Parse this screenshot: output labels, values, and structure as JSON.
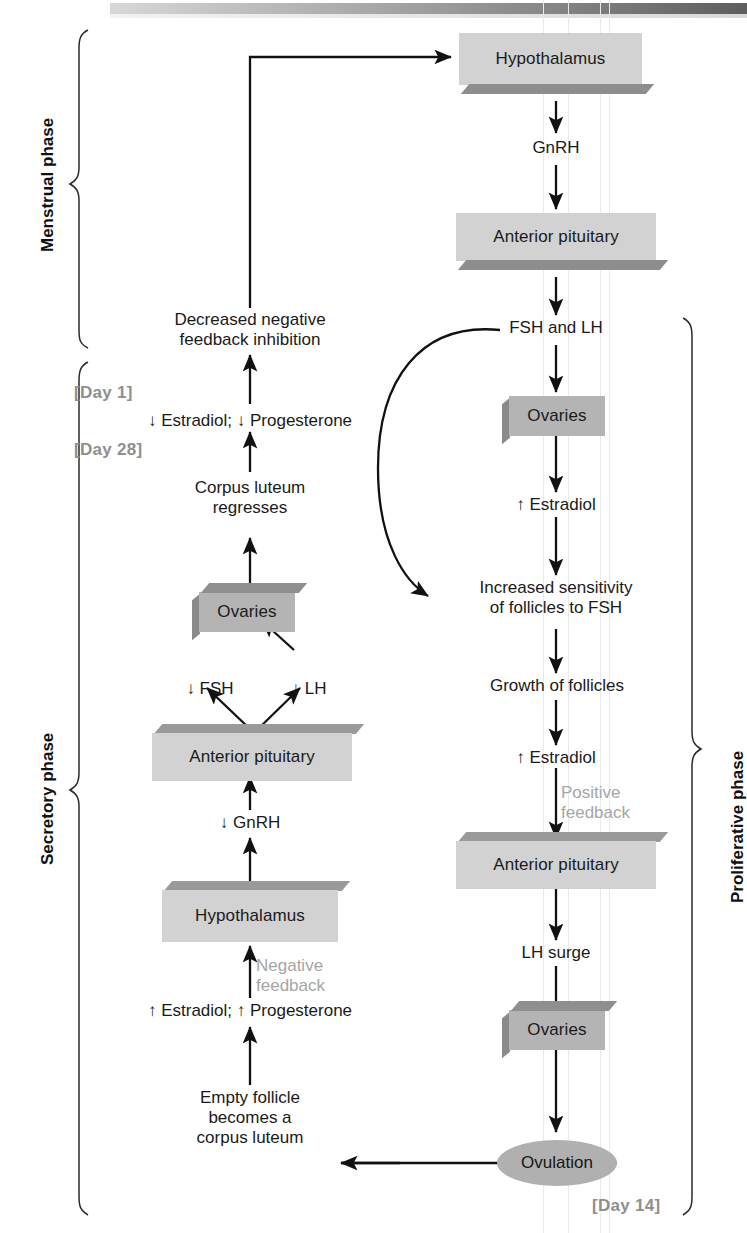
{
  "figure": {
    "title_text": "",
    "type": "flow-diagram"
  },
  "colors": {
    "box_light": "#d2d2d2",
    "box_mid": "#b4b4b4",
    "box_shadow": "#8d8d8d",
    "ellipse": "#b0b0b0",
    "gray_text": "#a6a6a6",
    "day_label": "#8f8f8f",
    "line": "#111111",
    "scanline": "#e9e9e9"
  },
  "phase_labels": {
    "menstrual": "Menstrual phase",
    "secretory": "Secretory phase",
    "proliferative": "Proliferative phase"
  },
  "day_markers": {
    "day1": "[Day 1]",
    "day28": "[Day 28]",
    "day14": "[Day 14]"
  },
  "feedback_labels": {
    "negative": "Negative\nfeedback",
    "positive": "Positive\nfeedback"
  },
  "right_column": {
    "nodes": [
      {
        "id": "hypothalamus-top",
        "kind": "box",
        "style": "light",
        "label": "Hypothalamus"
      },
      {
        "id": "gnrh",
        "kind": "text",
        "label": "GnRH"
      },
      {
        "id": "anterior-pituitary-top",
        "kind": "box",
        "style": "light",
        "label": "Anterior pituitary"
      },
      {
        "id": "fsh-and-lh",
        "kind": "text",
        "label": "FSH and LH"
      },
      {
        "id": "ovaries-upper-right",
        "kind": "box",
        "style": "mid",
        "label": "Ovaries"
      },
      {
        "id": "estradiol-up-1",
        "kind": "text",
        "label": "↑ Estradiol"
      },
      {
        "id": "increased-sensitivity",
        "kind": "text",
        "label": "Increased sensitivity\nof follicles to FSH"
      },
      {
        "id": "growth-of-follicles",
        "kind": "text",
        "label": "Growth of follicles"
      },
      {
        "id": "estradiol-up-2",
        "kind": "text",
        "label": "↑ Estradiol"
      },
      {
        "id": "anterior-pituitary-mid",
        "kind": "box",
        "style": "light",
        "label": "Anterior pituitary"
      },
      {
        "id": "lh-surge",
        "kind": "text",
        "label": "LH surge"
      },
      {
        "id": "ovaries-lower-right",
        "kind": "box",
        "style": "mid",
        "label": "Ovaries"
      },
      {
        "id": "ovulation",
        "kind": "ellipse",
        "label": "Ovulation"
      }
    ]
  },
  "left_column": {
    "nodes": [
      {
        "id": "decreased-negative-feedback",
        "kind": "text",
        "label": "Decreased negative\nfeedback inhibition"
      },
      {
        "id": "low-estradiol-progesterone",
        "kind": "text",
        "label": "↓ Estradiol; ↓ Progesterone"
      },
      {
        "id": "corpus-luteum-regresses",
        "kind": "text",
        "label": "Corpus luteum\nregresses"
      },
      {
        "id": "ovaries-left",
        "kind": "box",
        "style": "mid",
        "label": "Ovaries"
      },
      {
        "id": "fsh-down",
        "kind": "text",
        "label": "↓ FSH"
      },
      {
        "id": "lh-down",
        "kind": "text",
        "label": "↓ LH"
      },
      {
        "id": "anterior-pituitary-left",
        "kind": "box",
        "style": "light",
        "label": "Anterior pituitary"
      },
      {
        "id": "gnrh-down",
        "kind": "text",
        "label": "↓ GnRH"
      },
      {
        "id": "hypothalamus-left",
        "kind": "box",
        "style": "light",
        "label": "Hypothalamus"
      },
      {
        "id": "high-estradiol-progesterone",
        "kind": "text",
        "label": "↑ Estradiol; ↑ Progesterone"
      },
      {
        "id": "empty-follicle",
        "kind": "text",
        "label": "Empty follicle\nbecomes a\ncorpus luteum"
      }
    ]
  }
}
